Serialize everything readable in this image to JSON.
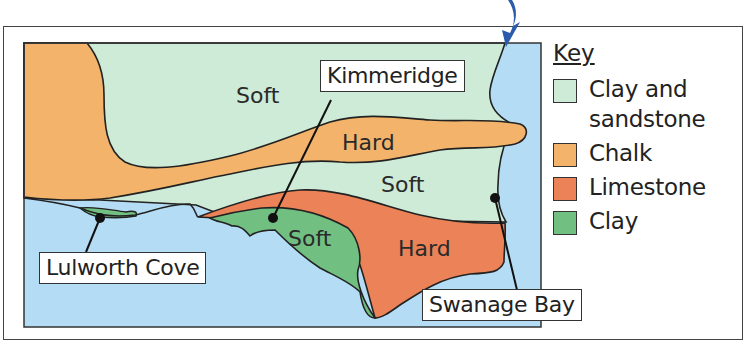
{
  "map": {
    "title": "Dorset coastline geology",
    "regions": [
      {
        "rock": "Clay and sandstone",
        "hardness": "Soft",
        "label_pos": "north"
      },
      {
        "rock": "Chalk",
        "hardness": "Hard",
        "label_pos": "middle band"
      },
      {
        "rock": "Clay and sandstone",
        "hardness": "Soft",
        "label_pos": "south band"
      },
      {
        "rock": "Limestone",
        "hardness": "Hard",
        "label_pos": "south-east"
      },
      {
        "rock": "Clay",
        "hardness": "Soft",
        "label_pos": "south"
      }
    ],
    "labels": {
      "soft_north": "Soft",
      "hard_chalk": "Hard",
      "soft_middle": "Soft",
      "soft_clay": "Soft",
      "hard_limestone": "Hard"
    },
    "places": {
      "kimmeridge": "Kimmeridge",
      "lulworth": "Lulworth Cove",
      "swanage": "Swanage Bay"
    }
  },
  "key": {
    "title": "Key",
    "items": [
      {
        "label": "Clay and",
        "label2": "sandstone",
        "color": "#cdebd6"
      },
      {
        "label": "Chalk",
        "color": "#f4b36a"
      },
      {
        "label": "Limestone",
        "color": "#ec8257"
      },
      {
        "label": "Clay",
        "color": "#72bf82"
      }
    ]
  },
  "colors": {
    "sea": "#b5dcf5",
    "clay_sandstone": "#cdebd6",
    "chalk": "#f4b36a",
    "limestone": "#ec8257",
    "clay": "#72bf82",
    "arrow": "#2b5cab"
  }
}
